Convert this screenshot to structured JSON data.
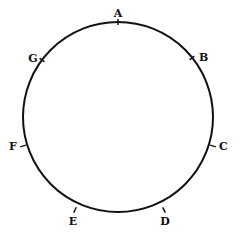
{
  "diagram": {
    "type": "circle-with-labeled-points",
    "circle": {
      "cx": 118,
      "cy": 117,
      "r": 95,
      "stroke": "#111111"
    },
    "points": [
      {
        "label": "A",
        "x": 118,
        "y": 22,
        "lx": 118,
        "ly": 17,
        "anchor": "middle"
      },
      {
        "label": "B",
        "x": 192,
        "y": 58,
        "lx": 199,
        "ly": 61,
        "anchor": "start"
      },
      {
        "label": "C",
        "x": 213,
        "y": 146,
        "lx": 219,
        "ly": 150,
        "anchor": "start"
      },
      {
        "label": "D",
        "x": 164,
        "y": 210,
        "lx": 165,
        "ly": 225,
        "anchor": "middle"
      },
      {
        "label": "E",
        "x": 75,
        "y": 210,
        "lx": 73,
        "ly": 225,
        "anchor": "middle"
      },
      {
        "label": "F",
        "x": 23,
        "y": 146,
        "lx": 13,
        "ly": 150,
        "anchor": "middle"
      },
      {
        "label": "G",
        "x": 42,
        "y": 60,
        "lx": 33,
        "ly": 62,
        "anchor": "middle"
      }
    ]
  }
}
